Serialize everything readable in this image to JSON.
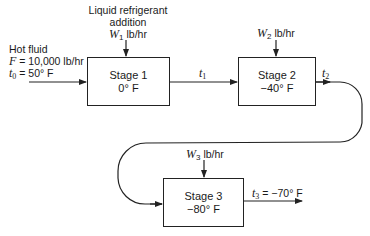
{
  "feed": {
    "title": "Hot fluid",
    "flow_symbol": "F",
    "flow_value": "= 10,000 lb/hr",
    "temp_symbol": "t",
    "temp_sub": "0",
    "temp_value": "= 50° F"
  },
  "refrigerant": {
    "line1": "Liquid refrigerant",
    "line2": "addition"
  },
  "stages": [
    {
      "name": "Stage 1",
      "temp": "0° F",
      "w_symbol": "W",
      "w_sub": "1",
      "w_unit": "lb/hr",
      "out_symbol": "t",
      "out_sub": "1",
      "out_value": ""
    },
    {
      "name": "Stage 2",
      "temp": "−40° F",
      "w_symbol": "W",
      "w_sub": "2",
      "w_unit": "lb/hr",
      "out_symbol": "t",
      "out_sub": "2",
      "out_value": ""
    },
    {
      "name": "Stage 3",
      "temp": "−80° F",
      "w_symbol": "W",
      "w_sub": "3",
      "w_unit": "lb/hr",
      "out_symbol": "t",
      "out_sub": "3",
      "out_value": "= −70° F"
    }
  ]
}
